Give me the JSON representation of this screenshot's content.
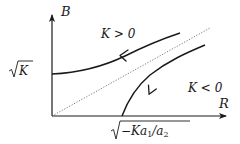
{
  "diagram": {
    "axes": {
      "y_label": "B",
      "x_label": "R",
      "y_tick_label_base": "K",
      "x_tick_label_base": "−Ka",
      "x_tick_sub1": "1",
      "x_tick_div": "/a",
      "x_tick_sub2": "2"
    },
    "regions": {
      "upper_label": "K > 0",
      "lower_label": "K < 0"
    },
    "colors": {
      "ink": "#1a1a1a",
      "dotted": "#555555"
    }
  }
}
